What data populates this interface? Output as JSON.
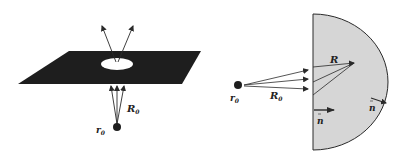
{
  "left_figure": {
    "description": "Dark plane with an elliptical aperture; point source below emits rays through the hole",
    "labels": {
      "source": "r",
      "source_sub": "0",
      "distance": "R",
      "distance_sub": "0"
    }
  },
  "right_figure": {
    "description": "Half-disk region (shaded) illuminated by point source from the left",
    "labels": {
      "source": "r",
      "source_sub": "0",
      "distance": "R",
      "distance_sub": "0",
      "inner_vector": "R",
      "normal_flat": "n",
      "normal_curved": "n"
    }
  },
  "colors": {
    "plane": "#1e1e1e",
    "region_fill": "#d6d6d6",
    "stroke": "#2a2a2a"
  }
}
